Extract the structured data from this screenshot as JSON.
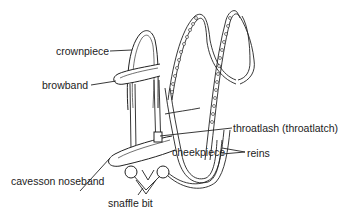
{
  "diagram": {
    "labels": [
      {
        "id": "crownpiece",
        "text": "crownpiece"
      },
      {
        "id": "browband",
        "text": "browband"
      },
      {
        "id": "throatlash",
        "text": "throatlash (throatlatch)"
      },
      {
        "id": "cheekpiece",
        "text": "cheekpiece"
      },
      {
        "id": "reins",
        "text": "reins"
      },
      {
        "id": "cavesson-noseband",
        "text": "cavesson noseband"
      },
      {
        "id": "snaffle-bit",
        "text": "snaffle bit"
      }
    ]
  }
}
